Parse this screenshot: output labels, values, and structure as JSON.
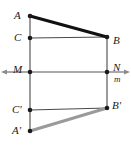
{
  "figure": {
    "kind": "geometry-diagram",
    "width": 131,
    "height": 147,
    "background_color": "#ffffff"
  },
  "colors": {
    "primary_segment": "#111111",
    "reflected_segment": "#9a9a9a",
    "construction_line": "#4a4a4a",
    "axis_line": "#8c8c8c",
    "point_fill": "#1a1a1a",
    "label_text": "#1a1a1a"
  },
  "geometry": {
    "points": [
      {
        "id": "A",
        "label": "A",
        "x": 30,
        "y": 16,
        "label_x": 14,
        "label_y": 10
      },
      {
        "id": "B",
        "label": "B",
        "x": 107,
        "y": 37,
        "label_x": 113,
        "label_y": 35
      },
      {
        "id": "C",
        "label": "C",
        "x": 30,
        "y": 38,
        "label_x": 14,
        "label_y": 32
      },
      {
        "id": "M",
        "label": "M",
        "x": 30,
        "y": 72,
        "label_x": 13,
        "label_y": 64
      },
      {
        "id": "N",
        "label": "N",
        "x": 107,
        "y": 72,
        "label_x": 113,
        "label_y": 62
      },
      {
        "id": "Cp",
        "label": "C'",
        "x": 30,
        "y": 110,
        "label_x": 12,
        "label_y": 104
      },
      {
        "id": "Bp",
        "label": "B'",
        "x": 107,
        "y": 108,
        "label_x": 112,
        "label_y": 100
      },
      {
        "id": "Ap",
        "label": "A'",
        "x": 30,
        "y": 131,
        "label_x": 12,
        "label_y": 125
      }
    ],
    "segments": [
      {
        "id": "AB",
        "from": "A",
        "to": "B",
        "style": "thick-black"
      },
      {
        "id": "ApBp",
        "from": "Ap",
        "to": "Bp",
        "style": "thick-gray"
      },
      {
        "id": "CB",
        "from": "C",
        "to": "B",
        "style": "thin"
      },
      {
        "id": "CpBp",
        "from": "Cp",
        "to": "Bp",
        "style": "thin"
      },
      {
        "id": "A-to-Ap",
        "from": "A",
        "to": "Ap",
        "style": "thin-vertical"
      },
      {
        "id": "B-to-Bp",
        "from": "B",
        "to": "Bp",
        "style": "thin-vertical"
      }
    ],
    "axis": {
      "id": "m",
      "label": "m",
      "label_x": 114,
      "label_y": 75,
      "y": 72,
      "x_start": 3,
      "x_end": 128,
      "arrow_both_ends": true
    }
  }
}
